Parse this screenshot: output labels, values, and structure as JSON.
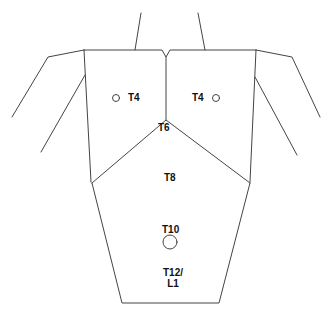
{
  "diagram": {
    "type": "dermatome-landmark-map",
    "view": "posterior torso outline",
    "line_color": "#444444",
    "text_color": "#111111",
    "labels": [
      {
        "id": "t4-left",
        "text": "T4",
        "x": 128,
        "y": 92
      },
      {
        "id": "t4-right",
        "text": "T4",
        "x": 192,
        "y": 92
      },
      {
        "id": "t6",
        "text": "T6",
        "x": 158,
        "y": 122
      },
      {
        "id": "t8",
        "text": "T8",
        "x": 164,
        "y": 172
      },
      {
        "id": "t10",
        "text": "T10",
        "x": 162,
        "y": 224
      },
      {
        "id": "t12-l1",
        "text": "T12/\nL1",
        "x": 163,
        "y": 267
      }
    ],
    "markers": [
      {
        "id": "t4-left-marker",
        "shape": "circle",
        "cx": 116,
        "cy": 98,
        "r": 3.5
      },
      {
        "id": "t4-right-marker",
        "shape": "circle",
        "cx": 216,
        "cy": 98,
        "r": 3.5
      },
      {
        "id": "t10-marker",
        "shape": "circle",
        "cx": 170,
        "cy": 242,
        "r": 7
      }
    ]
  }
}
